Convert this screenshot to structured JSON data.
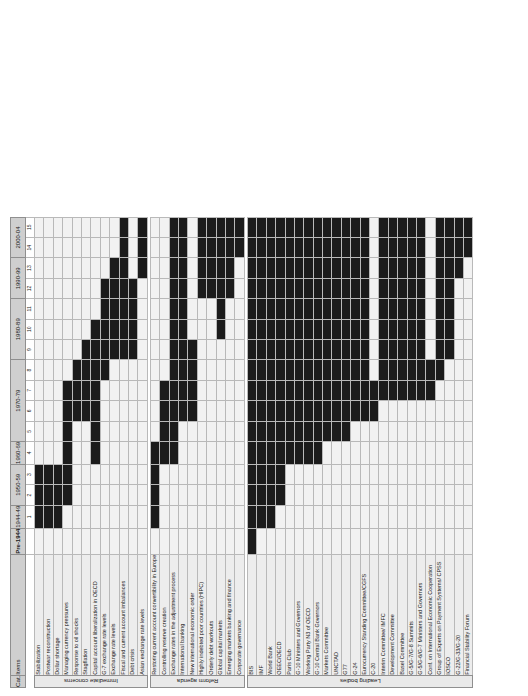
{
  "header": {
    "cat_label": "Cat.",
    "items_label": "Items"
  },
  "chart_data": {
    "type": "heatmap",
    "title": "",
    "xlabel": "",
    "ylabel": "",
    "grid": true,
    "legend_position": "none",
    "colors": {
      "filled": "#1b1b1b",
      "empty": "#f2f2f2",
      "header": "#cfcfcf",
      "itemband": "#ededed",
      "catband": "#e9e9e9"
    },
    "periods": [
      {
        "label": "Pre-1944",
        "cols": [
          ""
        ]
      },
      {
        "label": "1944-49",
        "cols": [
          "1"
        ]
      },
      {
        "label": "1950-59",
        "cols": [
          "2",
          "3"
        ]
      },
      {
        "label": "1960-69",
        "cols": [
          "4"
        ]
      },
      {
        "label": "1970-79",
        "cols": [
          "5",
          "6",
          "7",
          "8"
        ]
      },
      {
        "label": "1980-89",
        "cols": [
          "9",
          "10",
          "11"
        ]
      },
      {
        "label": "1990-99",
        "cols": [
          "12",
          "13"
        ]
      },
      {
        "label": "2000-04",
        "cols": [
          "14",
          "15"
        ]
      }
    ],
    "col_numbers": [
      "",
      "1",
      "2",
      "3",
      "4",
      "5",
      "6",
      "7",
      "8",
      "9",
      "10",
      "11",
      "12",
      "13",
      "14",
      "15"
    ],
    "categories": [
      {
        "name": "Immediate concerns",
        "rows": [
          {
            "label": "Stabilization",
            "values": [
              0,
              1,
              1,
              1,
              0,
              0,
              0,
              0,
              0,
              0,
              0,
              0,
              0,
              0,
              0,
              0
            ]
          },
          {
            "label": "Postwar reconstruction",
            "values": [
              0,
              1,
              1,
              1,
              0,
              0,
              0,
              0,
              0,
              0,
              0,
              0,
              0,
              0,
              0,
              0
            ]
          },
          {
            "label": "Dollar shortage",
            "values": [
              0,
              1,
              1,
              1,
              0,
              0,
              0,
              0,
              0,
              0,
              0,
              0,
              0,
              0,
              0,
              0
            ]
          },
          {
            "label": "Managing currency pressures",
            "values": [
              0,
              0,
              1,
              1,
              1,
              1,
              1,
              1,
              0,
              0,
              0,
              0,
              0,
              0,
              0,
              0
            ]
          },
          {
            "label": "Response to oil shocks",
            "values": [
              0,
              0,
              0,
              0,
              0,
              0,
              1,
              1,
              1,
              0,
              0,
              0,
              0,
              0,
              0,
              0
            ]
          },
          {
            "label": "Stagflation",
            "values": [
              0,
              0,
              0,
              0,
              0,
              0,
              1,
              1,
              1,
              1,
              0,
              0,
              0,
              0,
              0,
              0
            ]
          },
          {
            "label": "Capital account liberalization in OECD",
            "values": [
              0,
              0,
              0,
              0,
              1,
              1,
              1,
              1,
              1,
              1,
              1,
              0,
              0,
              0,
              0,
              0
            ]
          },
          {
            "label": "G-7 exchange rate levels",
            "values": [
              0,
              0,
              0,
              0,
              0,
              0,
              0,
              0,
              1,
              1,
              1,
              1,
              1,
              0,
              0,
              0
            ]
          },
          {
            "label": "Exchange rate levels",
            "values": [
              0,
              0,
              0,
              0,
              0,
              0,
              0,
              0,
              0,
              1,
              1,
              1,
              1,
              1,
              0,
              0
            ]
          },
          {
            "label": "Fiscal and current account imbalances",
            "values": [
              0,
              0,
              0,
              0,
              0,
              0,
              0,
              0,
              0,
              1,
              1,
              1,
              1,
              1,
              1,
              1
            ]
          },
          {
            "label": "Debt crisis",
            "values": [
              0,
              0,
              0,
              0,
              0,
              0,
              0,
              0,
              0,
              1,
              1,
              1,
              1,
              0,
              0,
              0
            ]
          },
          {
            "label": "Asian exchange rate levels",
            "values": [
              0,
              0,
              0,
              0,
              0,
              0,
              0,
              0,
              0,
              0,
              0,
              0,
              0,
              1,
              1,
              1
            ]
          }
        ]
      },
      {
        "name": "Reform agenda",
        "rows": [
          {
            "label": "Restoring current account convertibility in Europe",
            "values": [
              0,
              1,
              1,
              1,
              1,
              0,
              0,
              0,
              0,
              0,
              0,
              0,
              0,
              0,
              0,
              0
            ]
          },
          {
            "label": "Controlling reserve creation",
            "values": [
              0,
              0,
              0,
              0,
              1,
              1,
              1,
              1,
              0,
              0,
              0,
              0,
              0,
              0,
              0,
              0
            ]
          },
          {
            "label": "Exchange rates in the adjustment process",
            "values": [
              0,
              0,
              0,
              0,
              1,
              1,
              1,
              1,
              1,
              1,
              1,
              1,
              1,
              1,
              1,
              1
            ]
          },
          {
            "label": "International banking",
            "values": [
              0,
              0,
              0,
              0,
              0,
              0,
              1,
              1,
              1,
              1,
              1,
              1,
              1,
              1,
              1,
              1
            ]
          },
          {
            "label": "New international economic order",
            "values": [
              0,
              0,
              0,
              0,
              0,
              0,
              1,
              1,
              1,
              1,
              0,
              0,
              0,
              0,
              0,
              0
            ]
          },
          {
            "label": "Highly indebted poor countries (HIPC)",
            "values": [
              0,
              0,
              0,
              0,
              0,
              0,
              0,
              0,
              0,
              0,
              0,
              0,
              1,
              1,
              1,
              1
            ]
          },
          {
            "label": "Orderly debt workouts",
            "values": [
              0,
              0,
              0,
              0,
              0,
              0,
              0,
              0,
              0,
              0,
              0,
              0,
              1,
              1,
              1,
              1
            ]
          },
          {
            "label": "Global capital markets",
            "values": [
              0,
              0,
              0,
              0,
              0,
              0,
              0,
              0,
              0,
              0,
              1,
              1,
              1,
              1,
              1,
              1
            ]
          },
          {
            "label": "Emerging markets banking and finance",
            "values": [
              0,
              0,
              0,
              0,
              0,
              0,
              0,
              0,
              0,
              0,
              0,
              0,
              1,
              1,
              1,
              1
            ]
          },
          {
            "label": "Corporate governance",
            "values": [
              0,
              0,
              0,
              0,
              0,
              0,
              0,
              0,
              0,
              0,
              0,
              0,
              0,
              0,
              1,
              1
            ]
          }
        ]
      },
      {
        "name": "Leading bodies",
        "rows": [
          {
            "label": "BIS",
            "values": [
              1,
              1,
              1,
              1,
              1,
              1,
              1,
              1,
              1,
              1,
              1,
              1,
              1,
              1,
              1,
              1
            ]
          },
          {
            "label": "IMF",
            "values": [
              0,
              1,
              1,
              1,
              1,
              1,
              1,
              1,
              1,
              1,
              1,
              1,
              1,
              1,
              1,
              1
            ]
          },
          {
            "label": "World Bank",
            "values": [
              0,
              1,
              1,
              1,
              1,
              1,
              1,
              1,
              1,
              1,
              1,
              1,
              1,
              1,
              1,
              1
            ]
          },
          {
            "label": "OEEC/OECD",
            "values": [
              0,
              0,
              1,
              1,
              1,
              1,
              1,
              1,
              1,
              1,
              1,
              1,
              1,
              1,
              1,
              1
            ]
          },
          {
            "label": "Paris Club",
            "values": [
              0,
              0,
              0,
              0,
              1,
              1,
              1,
              1,
              1,
              1,
              1,
              1,
              1,
              1,
              1,
              1
            ]
          },
          {
            "label": "G-10 Ministers and Governors",
            "values": [
              0,
              0,
              0,
              0,
              1,
              1,
              1,
              1,
              1,
              1,
              1,
              1,
              1,
              1,
              1,
              1
            ]
          },
          {
            "label": "Working Party N3 of OECD",
            "values": [
              0,
              0,
              0,
              0,
              1,
              1,
              1,
              1,
              1,
              1,
              1,
              1,
              1,
              1,
              1,
              1
            ]
          },
          {
            "label": "G-10 Central Bank Governors",
            "values": [
              0,
              0,
              0,
              0,
              1,
              1,
              1,
              1,
              1,
              1,
              1,
              1,
              1,
              1,
              1,
              1
            ]
          },
          {
            "label": "Markets Committee",
            "values": [
              0,
              0,
              0,
              0,
              0,
              1,
              1,
              1,
              1,
              1,
              1,
              1,
              1,
              1,
              1,
              1
            ]
          },
          {
            "label": "UNCTAD",
            "values": [
              0,
              0,
              0,
              0,
              0,
              1,
              1,
              1,
              1,
              1,
              1,
              1,
              1,
              1,
              1,
              1
            ]
          },
          {
            "label": "G77",
            "values": [
              0,
              0,
              0,
              0,
              0,
              1,
              1,
              1,
              1,
              1,
              1,
              1,
              1,
              1,
              1,
              1
            ]
          },
          {
            "label": "G-24",
            "values": [
              0,
              0,
              0,
              0,
              0,
              0,
              1,
              1,
              1,
              1,
              1,
              1,
              1,
              1,
              1,
              1
            ]
          },
          {
            "label": "Eurocurrency Standing Committee/CGFS",
            "values": [
              0,
              0,
              0,
              0,
              0,
              0,
              1,
              1,
              1,
              1,
              1,
              1,
              1,
              1,
              1,
              1
            ]
          },
          {
            "label": "C-20",
            "values": [
              0,
              0,
              0,
              0,
              0,
              0,
              1,
              1,
              0,
              0,
              0,
              0,
              0,
              0,
              0,
              0
            ]
          },
          {
            "label": "Interim Committee/ IMFC",
            "values": [
              0,
              0,
              0,
              0,
              0,
              0,
              0,
              1,
              1,
              1,
              1,
              1,
              1,
              1,
              1,
              1
            ]
          },
          {
            "label": "Development Committee",
            "values": [
              0,
              0,
              0,
              0,
              0,
              0,
              0,
              1,
              1,
              1,
              1,
              1,
              1,
              1,
              1,
              1
            ]
          },
          {
            "label": "Basel Committee",
            "values": [
              0,
              0,
              0,
              0,
              0,
              0,
              0,
              1,
              1,
              1,
              1,
              1,
              1,
              1,
              1,
              1
            ]
          },
          {
            "label": "G-5/G-7/G-8 Summits",
            "values": [
              0,
              0,
              0,
              0,
              0,
              0,
              0,
              1,
              1,
              1,
              1,
              1,
              1,
              1,
              1,
              1
            ]
          },
          {
            "label": "G-5/G-6/G-7 Ministers and Governors",
            "values": [
              0,
              0,
              0,
              0,
              0,
              0,
              0,
              1,
              1,
              1,
              1,
              1,
              1,
              1,
              1,
              1
            ]
          },
          {
            "label": "Conf. on International Economic Cooperation",
            "values": [
              0,
              0,
              0,
              0,
              0,
              0,
              0,
              1,
              1,
              0,
              0,
              0,
              0,
              0,
              0,
              0
            ]
          },
          {
            "label": "Group of Experts on Payment Systems/ CPSS",
            "values": [
              0,
              0,
              0,
              0,
              0,
              0,
              0,
              0,
              1,
              1,
              1,
              1,
              1,
              1,
              1,
              1
            ]
          },
          {
            "label": "IOSCO",
            "values": [
              0,
              0,
              0,
              0,
              0,
              0,
              0,
              0,
              0,
              1,
              1,
              1,
              1,
              1,
              1,
              1
            ]
          },
          {
            "label": "G-22/G-33/G-20",
            "values": [
              0,
              0,
              0,
              0,
              0,
              0,
              0,
              0,
              0,
              0,
              0,
              0,
              0,
              1,
              1,
              1
            ]
          },
          {
            "label": "Financial Stability Forum",
            "values": [
              0,
              0,
              0,
              0,
              0,
              0,
              0,
              0,
              0,
              0,
              0,
              0,
              0,
              0,
              1,
              1
            ]
          }
        ]
      }
    ]
  }
}
